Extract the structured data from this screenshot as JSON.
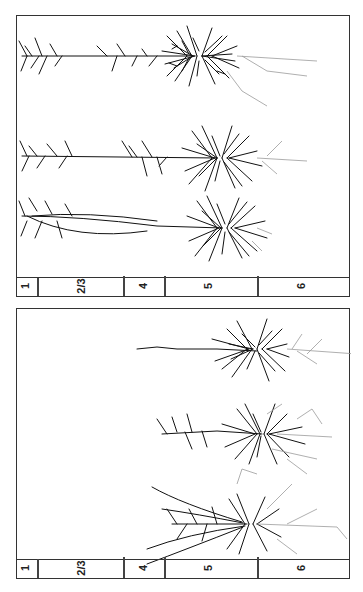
{
  "figure": {
    "panels": [
      {
        "id": "top",
        "layers": [
          {
            "label": "1",
            "x": 26
          },
          {
            "label": "2/3",
            "x": 80
          },
          {
            "label": "4",
            "x": 144
          },
          {
            "label": "5",
            "x": 210
          },
          {
            "label": "6",
            "x": 303
          }
        ],
        "neuron_count": 3
      },
      {
        "id": "bottom",
        "layers": [
          {
            "label": "1",
            "x": 26
          },
          {
            "label": "2/3",
            "x": 80
          },
          {
            "label": "4",
            "x": 144
          },
          {
            "label": "5",
            "x": 210
          },
          {
            "label": "6",
            "x": 303
          }
        ],
        "neuron_count": 3
      }
    ],
    "layer_dividers_x": [
      37,
      123,
      164,
      257
    ],
    "colors": {
      "dendrite": "#111111",
      "axon": "#9a9a9a",
      "border": "#333333"
    }
  }
}
